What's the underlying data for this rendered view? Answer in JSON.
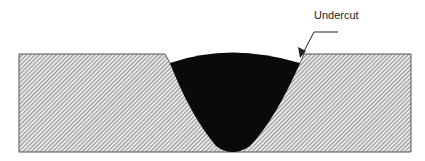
{
  "diagram": {
    "annotation": {
      "label": "Undercut"
    },
    "colors": {
      "plate_fill": "#d9d9d9",
      "hatch": "#6e6e6e",
      "outline": "#555555",
      "weld": "#0a0a0a",
      "text": "#222222"
    }
  }
}
